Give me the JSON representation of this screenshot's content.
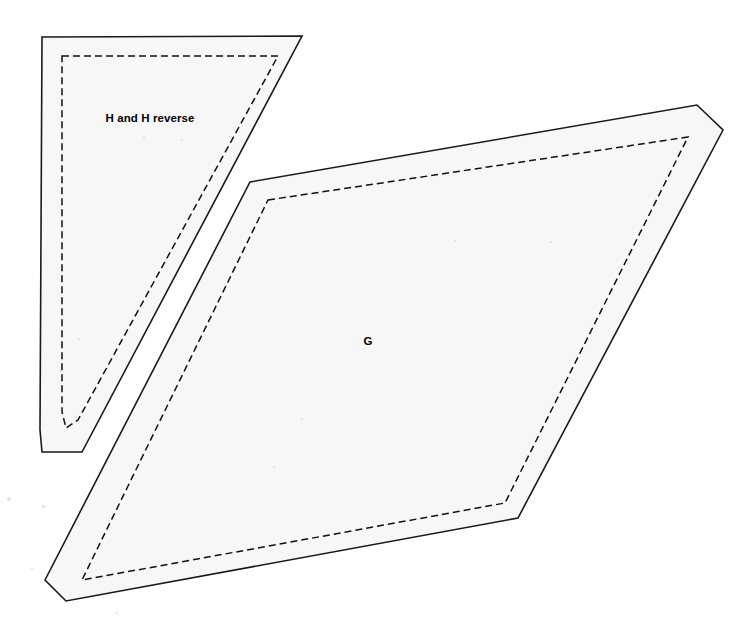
{
  "canvas": {
    "width": 755,
    "height": 635,
    "background_color": "#ffffff"
  },
  "style": {
    "piece_fill_color": "#f7f7f7",
    "cut_line_color": "#1a1a1a",
    "seam_line_color": "#111111",
    "label_color": "#000000",
    "cut_line_width": 1.6,
    "seam_line_width": 1.5,
    "seam_dash_pattern": "7 4"
  },
  "pieces": [
    {
      "id": "piece-h",
      "label": "H and H reverse",
      "label_position": {
        "x": 150,
        "y": 122
      },
      "cut_line_points": "42,37 302,36 82,452 42,452 40,430",
      "seam_line_points": "62,56 278,56 78,420 66,428 62,412"
    },
    {
      "id": "piece-g",
      "label": "G",
      "label_position": {
        "x": 368,
        "y": 345
      },
      "cut_line_points": "250,182 697,105 723,130 518,518 66,601 45,580",
      "seam_line_points": "268,200 688,137 505,503 82,580"
    }
  ],
  "specks": [
    {
      "x": 7,
      "y": 497,
      "size": 4
    },
    {
      "x": 42,
      "y": 505,
      "size": 3
    },
    {
      "x": 31,
      "y": 568,
      "size": 2
    },
    {
      "x": 78,
      "y": 338,
      "size": 2
    },
    {
      "x": 59,
      "y": 370,
      "size": 2
    },
    {
      "x": 143,
      "y": 137,
      "size": 2
    },
    {
      "x": 181,
      "y": 139,
      "size": 2
    },
    {
      "x": 301,
      "y": 418,
      "size": 2
    },
    {
      "x": 273,
      "y": 466,
      "size": 2
    },
    {
      "x": 454,
      "y": 240,
      "size": 2
    },
    {
      "x": 550,
      "y": 241,
      "size": 2
    },
    {
      "x": 116,
      "y": 612,
      "size": 2
    }
  ]
}
